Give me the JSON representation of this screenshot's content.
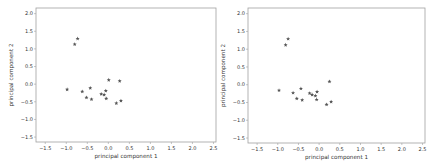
{
  "chart_data": [
    {
      "type": "scatter",
      "title": "",
      "xlabel": "principal component 1",
      "ylabel": "principal component 2",
      "xlim": [
        -1.72,
        2.56
      ],
      "ylim": [
        -1.64,
        2.16
      ],
      "xticks": [
        "-1.5",
        "-1.0",
        "-0.5",
        "0.0",
        "0.5",
        "1.0",
        "1.5",
        "2.0",
        "2.5"
      ],
      "yticks": [
        "-1.5",
        "-1.0",
        "-0.5",
        "0.0",
        "0.5",
        "1.0",
        "1.5",
        "2.0"
      ],
      "grid": false,
      "marker": "*",
      "points": [
        {
          "x": -0.8,
          "y": 1.13
        },
        {
          "x": -0.73,
          "y": 1.29
        },
        {
          "x": -0.98,
          "y": -0.15
        },
        {
          "x": -0.62,
          "y": -0.21
        },
        {
          "x": -0.43,
          "y": -0.11
        },
        {
          "x": -0.52,
          "y": -0.38
        },
        {
          "x": -0.4,
          "y": -0.43
        },
        {
          "x": 0.01,
          "y": 0.12
        },
        {
          "x": 0.27,
          "y": 0.09
        },
        {
          "x": -0.17,
          "y": -0.28
        },
        {
          "x": -0.06,
          "y": -0.19
        },
        {
          "x": -0.1,
          "y": -0.3
        },
        {
          "x": -0.05,
          "y": -0.41
        },
        {
          "x": 0.19,
          "y": -0.54
        },
        {
          "x": 0.3,
          "y": -0.47
        }
      ]
    },
    {
      "type": "scatter",
      "title": "",
      "xlabel": "principal component 1",
      "ylabel": "principal component 2",
      "xlim": [
        -1.72,
        2.56
      ],
      "ylim": [
        -1.64,
        2.16
      ],
      "xticks": [
        "-1.5",
        "-1.0",
        "-0.5",
        "0.0",
        "0.5",
        "1.0",
        "1.5",
        "2.0",
        "2.5"
      ],
      "yticks": [
        "-1.5",
        "-1.0",
        "-0.5",
        "0.0",
        "0.5",
        "1.0",
        "1.5",
        "2.0"
      ],
      "grid": false,
      "marker": "*",
      "points": [
        {
          "x": -0.81,
          "y": 1.12
        },
        {
          "x": -0.75,
          "y": 1.29
        },
        {
          "x": -0.97,
          "y": -0.16
        },
        {
          "x": -0.63,
          "y": -0.23
        },
        {
          "x": -0.44,
          "y": -0.11
        },
        {
          "x": -0.54,
          "y": -0.39
        },
        {
          "x": -0.41,
          "y": -0.43
        },
        {
          "x": 0.25,
          "y": 0.09
        },
        {
          "x": -0.23,
          "y": -0.24
        },
        {
          "x": -0.17,
          "y": -0.28
        },
        {
          "x": -0.05,
          "y": -0.2
        },
        {
          "x": -0.09,
          "y": -0.31
        },
        {
          "x": -0.06,
          "y": -0.42
        },
        {
          "x": 0.18,
          "y": -0.56
        },
        {
          "x": 0.29,
          "y": -0.48
        }
      ]
    }
  ],
  "style": {
    "frame_color": "#a0a0a0",
    "marker_color": "#555555",
    "text_color": "#333333"
  }
}
